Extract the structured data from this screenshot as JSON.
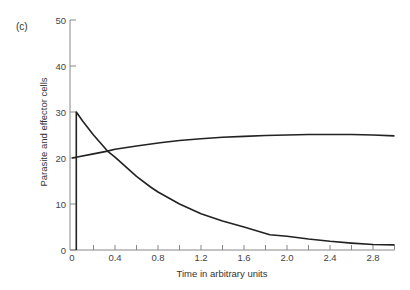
{
  "chart_data": {
    "type": "line",
    "panel_label": "(c)",
    "title": "",
    "xlabel": "Time in arbitrary units",
    "ylabel": "Parasite and effector cells",
    "xlim": [
      0,
      3.0
    ],
    "ylim": [
      0,
      50
    ],
    "x_ticks": [
      0,
      0.2,
      0.4,
      0.6,
      0.8,
      1.0,
      1.2,
      1.4,
      1.6,
      1.8,
      2.0,
      2.2,
      2.4,
      2.6,
      2.8,
      3.0
    ],
    "x_tick_labels": [
      "0",
      "0.4",
      "0.8",
      "1.2",
      "1.6",
      "2.0",
      "2.4",
      "2.8"
    ],
    "x_tick_label_values": [
      0,
      0.4,
      0.8,
      1.2,
      1.6,
      2.0,
      2.4,
      2.8
    ],
    "y_ticks": [
      0,
      10,
      20,
      30,
      40,
      50
    ],
    "y_tick_labels": [
      "0",
      "10",
      "20",
      "30",
      "40",
      "50"
    ],
    "grid": false,
    "legend": null,
    "series": [
      {
        "name": "Parasite cells (decaying)",
        "x": [
          0.04,
          0.04,
          0.1,
          0.2,
          0.33,
          0.4,
          0.6,
          0.73,
          0.8,
          1.0,
          1.2,
          1.4,
          1.6,
          1.84,
          2.0,
          2.2,
          2.4,
          2.6,
          2.8,
          3.0
        ],
        "values": [
          0,
          30,
          28.0,
          25.0,
          21.5,
          20.2,
          16.0,
          13.7,
          12.6,
          10.0,
          7.9,
          6.3,
          5.0,
          3.3,
          3.0,
          2.4,
          1.9,
          1.5,
          1.2,
          1.1
        ]
      },
      {
        "name": "Effector cells (rising)",
        "x": [
          0,
          0.2,
          0.33,
          0.4,
          0.6,
          0.82,
          1.0,
          1.2,
          1.4,
          1.6,
          1.8,
          2.0,
          2.2,
          2.4,
          2.6,
          2.8,
          3.0
        ],
        "values": [
          20,
          20.9,
          21.5,
          21.9,
          22.6,
          23.3,
          23.8,
          24.2,
          24.5,
          24.7,
          24.9,
          25.0,
          25.1,
          25.1,
          25.1,
          25.0,
          24.8
        ]
      }
    ]
  },
  "geometry": {
    "x0_px": 72,
    "px_per_x": 107.5,
    "y0_px": 250,
    "px_per_y": 4.6
  }
}
